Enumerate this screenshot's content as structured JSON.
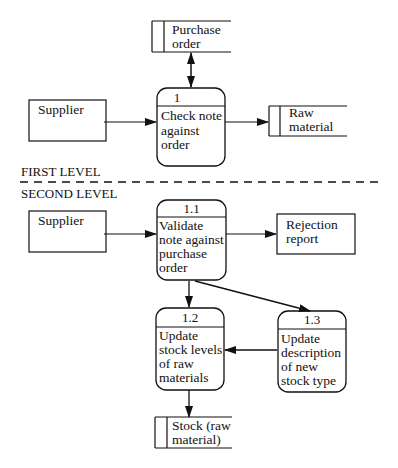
{
  "levels": {
    "first": "FIRST LEVEL",
    "second": "SECOND LEVEL"
  },
  "first_level": {
    "external_entity": {
      "label": "Supplier"
    },
    "process": {
      "id": "1",
      "lines": [
        "Check note",
        "against",
        "order"
      ]
    },
    "stores": {
      "purchase_order": {
        "lines": [
          "Purchase",
          "order"
        ]
      },
      "raw_material": {
        "lines": [
          "Raw",
          "material"
        ]
      }
    }
  },
  "second_level": {
    "external_entity": {
      "label": "Supplier"
    },
    "output_entity": {
      "lines": [
        "Rejection",
        "report"
      ]
    },
    "processes": [
      {
        "id": "1.1",
        "lines": [
          "Validate",
          "note against",
          "purchase",
          "order"
        ]
      },
      {
        "id": "1.2",
        "lines": [
          "Update",
          "stock levels",
          "of raw",
          "materials"
        ]
      },
      {
        "id": "1.3",
        "lines": [
          "Update",
          "description",
          "of new",
          "stock type"
        ]
      }
    ],
    "store": {
      "lines": [
        "Stock (raw",
        "material)"
      ]
    }
  },
  "colors": {
    "stroke": "#111111",
    "background": "#ffffff"
  }
}
